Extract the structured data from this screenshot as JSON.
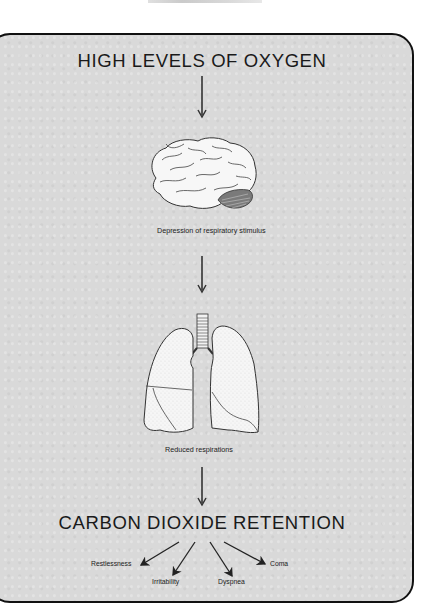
{
  "diagram": {
    "title_top": "HIGH LEVELS OF OXYGEN",
    "step1_caption": "Depression of respiratory stimulus",
    "step2_caption": "Reduced respirations",
    "title_bottom": "CARBON DIOXIDE RETENTION",
    "illustrations": [
      {
        "name": "brain",
        "caption_ref": "step1_caption"
      },
      {
        "name": "lungs",
        "caption_ref": "step2_caption"
      }
    ],
    "outcomes": [
      {
        "label": "Restlessness"
      },
      {
        "label": "Irritability"
      },
      {
        "label": "Dyspnea"
      },
      {
        "label": "Coma"
      }
    ],
    "colors": {
      "panel_background": "#d9d9d9",
      "panel_border": "#111111",
      "ink": "#1e1e1e",
      "illustration_fill": "#f4f4f4"
    }
  }
}
